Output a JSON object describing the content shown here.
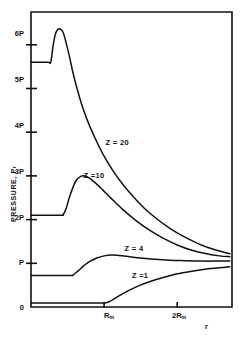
{
  "figure": {
    "axis_color": "#111111",
    "curve_color": "#111111",
    "background": "#ffffff"
  },
  "chart_data": {
    "type": "line",
    "title": "",
    "xlabel": "r",
    "ylabel": "PRESSURE, P",
    "ylabel_sub": "r",
    "grid": false,
    "legend": "inline-curve-labels",
    "xlim": [
      0,
      2.75
    ],
    "ylim": [
      0,
      6.75
    ],
    "x_unit": "R_m",
    "y_unit": "P",
    "xticks": [
      {
        "value": 0,
        "label": "0"
      },
      {
        "value": 1,
        "label": "R",
        "sub": "m"
      },
      {
        "value": 2,
        "label": "2R",
        "sub": "m"
      }
    ],
    "yticks": [
      {
        "value": 0,
        "label": "0"
      },
      {
        "value": 1,
        "label": "P"
      },
      {
        "value": 2,
        "label": "2P"
      },
      {
        "value": 3,
        "label": "3P"
      },
      {
        "value": 4,
        "label": "4P"
      },
      {
        "value": 5,
        "label": "5P"
      },
      {
        "value": 6,
        "label": "6P"
      }
    ],
    "series": [
      {
        "name": "Z = 20",
        "label": "Z = 20",
        "label_x": 1.02,
        "label_y": 3.78,
        "points": [
          [
            0.0,
            5.6
          ],
          [
            0.23,
            5.6
          ],
          [
            0.27,
            5.6
          ],
          [
            0.3,
            5.95
          ],
          [
            0.33,
            6.22
          ],
          [
            0.36,
            6.34
          ],
          [
            0.4,
            6.36
          ],
          [
            0.44,
            6.28
          ],
          [
            0.48,
            6.05
          ],
          [
            0.53,
            5.7
          ],
          [
            0.58,
            5.32
          ],
          [
            0.65,
            4.88
          ],
          [
            0.72,
            4.5
          ],
          [
            0.8,
            4.15
          ],
          [
            0.9,
            3.78
          ],
          [
            1.0,
            3.45
          ],
          [
            1.12,
            3.12
          ],
          [
            1.25,
            2.82
          ],
          [
            1.4,
            2.52
          ],
          [
            1.55,
            2.26
          ],
          [
            1.72,
            2.02
          ],
          [
            1.9,
            1.8
          ],
          [
            2.08,
            1.62
          ],
          [
            2.25,
            1.48
          ],
          [
            2.42,
            1.36
          ],
          [
            2.58,
            1.28
          ],
          [
            2.72,
            1.22
          ]
        ]
      },
      {
        "name": "Z = 10",
        "label": "Z =10",
        "label_x": 0.72,
        "label_y": 3.02,
        "points": [
          [
            0.0,
            2.1
          ],
          [
            0.4,
            2.1
          ],
          [
            0.44,
            2.12
          ],
          [
            0.48,
            2.25
          ],
          [
            0.52,
            2.48
          ],
          [
            0.57,
            2.72
          ],
          [
            0.62,
            2.9
          ],
          [
            0.68,
            2.99
          ],
          [
            0.74,
            3.0
          ],
          [
            0.8,
            2.95
          ],
          [
            0.88,
            2.84
          ],
          [
            0.98,
            2.68
          ],
          [
            1.1,
            2.48
          ],
          [
            1.25,
            2.24
          ],
          [
            1.42,
            2.0
          ],
          [
            1.6,
            1.78
          ],
          [
            1.8,
            1.58
          ],
          [
            2.0,
            1.42
          ],
          [
            2.2,
            1.3
          ],
          [
            2.4,
            1.22
          ],
          [
            2.58,
            1.17
          ],
          [
            2.72,
            1.15
          ]
        ]
      },
      {
        "name": "Z = 4",
        "label": "Z = 4",
        "label_x": 1.28,
        "label_y": 1.34,
        "points": [
          [
            0.0,
            0.72
          ],
          [
            0.52,
            0.72
          ],
          [
            0.58,
            0.74
          ],
          [
            0.64,
            0.82
          ],
          [
            0.72,
            0.94
          ],
          [
            0.8,
            1.04
          ],
          [
            0.9,
            1.12
          ],
          [
            1.0,
            1.17
          ],
          [
            1.1,
            1.19
          ],
          [
            1.2,
            1.18
          ],
          [
            1.35,
            1.15
          ],
          [
            1.5,
            1.12
          ],
          [
            1.7,
            1.09
          ],
          [
            1.9,
            1.07
          ],
          [
            2.1,
            1.06
          ],
          [
            2.35,
            1.05
          ],
          [
            2.55,
            1.05
          ],
          [
            2.72,
            1.05
          ]
        ]
      },
      {
        "name": "Z = 1",
        "label": "Z =1",
        "label_x": 1.38,
        "label_y": 0.74,
        "points": [
          [
            0.0,
            0.09
          ],
          [
            0.5,
            0.09
          ],
          [
            0.95,
            0.09
          ],
          [
            1.0,
            0.09
          ],
          [
            1.05,
            0.11
          ],
          [
            1.12,
            0.17
          ],
          [
            1.22,
            0.27
          ],
          [
            1.34,
            0.38
          ],
          [
            1.48,
            0.49
          ],
          [
            1.64,
            0.59
          ],
          [
            1.82,
            0.68
          ],
          [
            2.0,
            0.76
          ],
          [
            2.2,
            0.82
          ],
          [
            2.4,
            0.87
          ],
          [
            2.58,
            0.9
          ],
          [
            2.72,
            0.92
          ]
        ]
      }
    ]
  }
}
